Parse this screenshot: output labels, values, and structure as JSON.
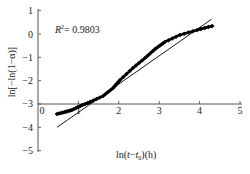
{
  "chart_data": {
    "type": "scatter",
    "title": "",
    "xlabel": "ln(t−t0)(h)",
    "ylabel": "ln[−ln(1−α)]",
    "xlim": [
      0,
      5
    ],
    "ylim": [
      -5,
      1
    ],
    "x_ticks": [
      0,
      1,
      2,
      3,
      4,
      5
    ],
    "y_ticks": [
      1,
      0,
      -1,
      -2,
      -3,
      -4,
      -5
    ],
    "x_axis_crosses_y_at": -3,
    "grid": false,
    "legend": null,
    "annotation": "R² = 0.9803",
    "series": [
      {
        "name": "data",
        "style": "line-with-diamond-markers",
        "color": "#000000",
        "x": [
          0.47,
          0.67,
          0.84,
          1.04,
          1.29,
          1.61,
          1.86,
          2.03,
          2.35,
          2.65,
          2.9,
          3.14,
          3.51,
          3.94,
          4.31
        ],
        "y": [
          -3.43,
          -3.34,
          -3.26,
          -3.09,
          -2.91,
          -2.66,
          -2.31,
          -1.97,
          -1.46,
          -1.03,
          -0.64,
          -0.34,
          -0.04,
          0.17,
          0.34
        ]
      },
      {
        "name": "linear fit",
        "style": "line",
        "color": "#000000",
        "x": [
          0.47,
          4.3
        ],
        "y": [
          -4.0,
          0.64
        ]
      }
    ]
  },
  "labels": {
    "x_title_main": "ln(",
    "x_title_t": "t",
    "x_title_minus": "−",
    "x_title_t0": "t",
    "x_title_sub": "0",
    "x_title_tail": ")(h)",
    "y_title": "ln[−ln(1−α)]",
    "r2_label": "R",
    "r2_sup": "2",
    "r2_value": "= 0.9803"
  }
}
